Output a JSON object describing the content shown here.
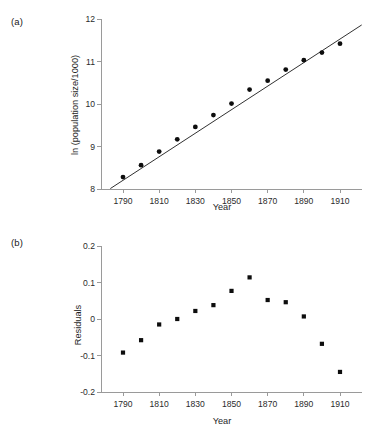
{
  "figure": {
    "panels": [
      {
        "tag": "(a)",
        "name": "population-growth-plot"
      },
      {
        "tag": "(b)",
        "name": "residuals-plot"
      }
    ]
  },
  "chart_data": [
    {
      "type": "scatter",
      "title": "",
      "panel_label": "(a)",
      "xlabel": "Year",
      "ylabel": "ln (population size/1000)",
      "xlim": [
        1775,
        1925
      ],
      "ylim": [
        8,
        12
      ],
      "xticks": [
        1790,
        1810,
        1830,
        1850,
        1870,
        1890,
        1910
      ],
      "xtick_labels": [
        "1790",
        "1810",
        "1830",
        "1850",
        "1870",
        "1890",
        "1910"
      ],
      "yticks": [
        8,
        9,
        10,
        11,
        12
      ],
      "ytick_labels": [
        "8",
        "9",
        "10",
        "11",
        "12"
      ],
      "grid": false,
      "legend": null,
      "x": [
        1790,
        1800,
        1810,
        1820,
        1830,
        1840,
        1850,
        1860,
        1870,
        1880,
        1890,
        1900,
        1910
      ],
      "y": [
        8.28,
        8.56,
        8.88,
        9.17,
        9.46,
        9.74,
        10.01,
        10.34,
        10.55,
        10.81,
        11.03,
        11.21,
        11.42
      ],
      "marker": "filled-circle",
      "fit_line": {
        "label": "least-squares regression line",
        "x": [
          1783,
          1922
        ],
        "y": [
          8.01,
          11.86
        ],
        "slope_per_year": 0.0277,
        "intercept_at_1790": 8.2
      }
    },
    {
      "type": "scatter",
      "title": "",
      "panel_label": "(b)",
      "xlabel": "Year",
      "ylabel": "Residuals",
      "xlim": [
        1775,
        1925
      ],
      "ylim": [
        -0.2,
        0.2
      ],
      "xticks": [
        1790,
        1810,
        1830,
        1850,
        1870,
        1890,
        1910
      ],
      "xtick_labels": [
        "1790",
        "1810",
        "1830",
        "1850",
        "1870",
        "1890",
        "1910"
      ],
      "yticks": [
        -0.2,
        -0.1,
        0,
        0.1,
        0.2
      ],
      "ytick_labels": [
        "-0.2",
        "-0.1",
        "0",
        "0.1",
        "0.2"
      ],
      "grid": false,
      "legend": null,
      "x": [
        1790,
        1800,
        1810,
        1820,
        1830,
        1840,
        1850,
        1860,
        1870,
        1880,
        1890,
        1900,
        1910
      ],
      "y": [
        -0.092,
        -0.058,
        -0.015,
        0.0,
        0.022,
        0.038,
        0.077,
        0.114,
        0.052,
        0.046,
        0.007,
        -0.068,
        -0.145
      ],
      "marker": "filled-square"
    }
  ]
}
